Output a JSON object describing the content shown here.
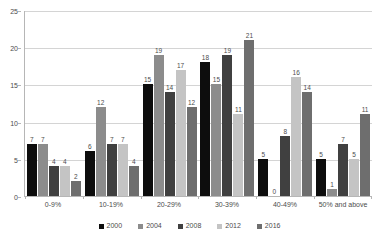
{
  "chart_data": {
    "type": "bar",
    "title": "",
    "subtitle": "",
    "xlabel": "",
    "ylabel": "",
    "ylim": [
      0,
      25
    ],
    "yticks": [
      0,
      5,
      10,
      15,
      20,
      25
    ],
    "grid": true,
    "legend_position": "bottom",
    "categories": [
      "0-9%",
      "10-19%",
      "20-29%",
      "30-39%",
      "40-49%",
      "50% and above"
    ],
    "series": [
      {
        "name": "2000",
        "color": "#0d0d0d",
        "values": [
          7,
          6,
          15,
          18,
          5,
          5
        ]
      },
      {
        "name": "2004",
        "color": "#8c8c8c",
        "values": [
          7,
          12,
          19,
          15,
          0,
          1
        ]
      },
      {
        "name": "2008",
        "color": "#404040",
        "values": [
          4,
          7,
          14,
          19,
          8,
          7
        ]
      },
      {
        "name": "2012",
        "color": "#c4c4c4",
        "values": [
          4,
          7,
          17,
          11,
          16,
          5
        ]
      },
      {
        "name": "2016",
        "color": "#6e6e6e",
        "values": [
          2,
          4,
          12,
          21,
          14,
          11
        ]
      }
    ],
    "data_labels": [
      [
        "7",
        "7",
        "4",
        "4",
        "2"
      ],
      [
        "6",
        "12",
        "7",
        "7",
        "4"
      ],
      [
        "15",
        "19",
        "14",
        "17",
        "12"
      ],
      [
        "18",
        "15",
        "19",
        "11",
        "21"
      ],
      [
        "5",
        "0",
        "8",
        "16",
        "14"
      ],
      [
        "5",
        "1",
        "7",
        "5",
        "11"
      ]
    ],
    "axis_color": "#b6b6b6",
    "gridline_color": "#d4d4d4",
    "text_color": "#4c4c4c",
    "background": "#ffffff"
  }
}
